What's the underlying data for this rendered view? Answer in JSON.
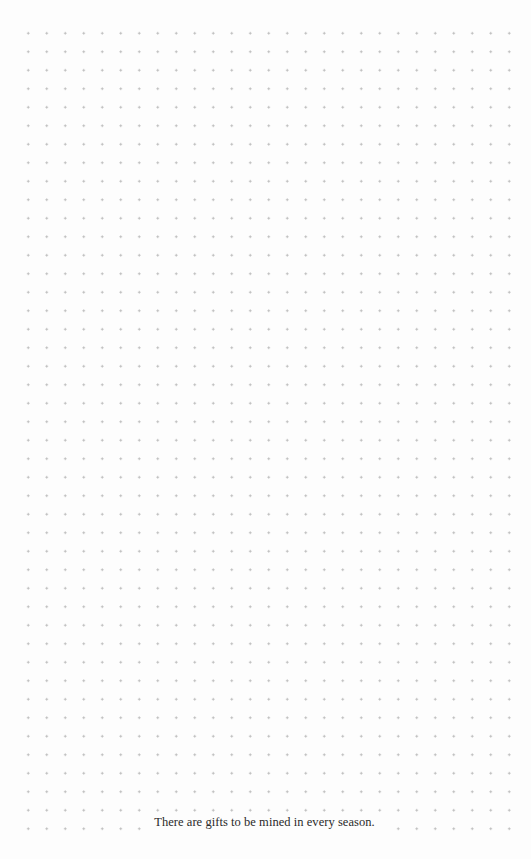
{
  "page": {
    "type": "dot-grid notebook page",
    "background_color": "#fdfdfd",
    "dot_color": "#b9b9b9",
    "grid": {
      "columns": 27,
      "rows": 44,
      "spacing_px": 18.5
    }
  },
  "footer": {
    "quote": "There are gifts to be mined in every season."
  }
}
